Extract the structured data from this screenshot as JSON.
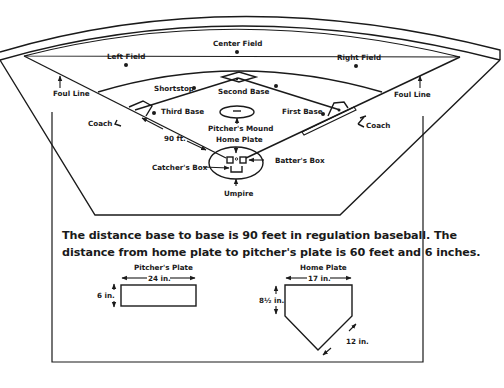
{
  "field": {
    "labels": {
      "left_field": "Left Field",
      "center_field": "Center Field",
      "right_field": "Right Field",
      "shortstop": "Shortstop",
      "second_base": "Second Base",
      "third_base": "Third Base",
      "first_base": "First Base",
      "pitchers_mound": "Pitcher's Mound",
      "home_plate": "Home Plate",
      "foul_line_left": "Foul Line",
      "foul_line_right": "Foul Line",
      "coach_left": "Coach",
      "coach_right": "Coach",
      "ninety_ft": "90 ft.",
      "catchers_box": "Catcher's Box",
      "batters_box": "Batter's Box",
      "umpire": "Umpire"
    }
  },
  "description": "The distance base to base is 90 feet in regulation baseball. The distance from home plate to pitcher's plate is 60 feet and 6 inches.",
  "pitchers_plate": {
    "title": "Pitcher's Plate",
    "width_label": "24 in.",
    "height_label": "6 in."
  },
  "home_plate_detail": {
    "title": "Home Plate",
    "width_label": "17 in.",
    "side_label": "8½ in.",
    "diagonal_label": "12 in."
  },
  "colors": {
    "ink": "#1a1a1a",
    "background": "#ffffff"
  }
}
